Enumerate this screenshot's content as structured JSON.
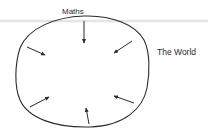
{
  "diagram": {
    "labels": {
      "top": "Maths",
      "right": "The World"
    },
    "colors": {
      "stroke": "#2a2a2a",
      "background": "#ffffff",
      "band": "#cdcdcd"
    },
    "arrows": [
      {
        "name": "arrow-top",
        "direction": "inward",
        "from": [
          84,
          21
        ],
        "to": [
          84,
          43
        ]
      },
      {
        "name": "arrow-upper-left",
        "direction": "inward",
        "from": [
          27,
          47
        ],
        "to": [
          45,
          55
        ]
      },
      {
        "name": "arrow-upper-right",
        "direction": "inward",
        "from": [
          132,
          41
        ],
        "to": [
          114,
          53
        ]
      },
      {
        "name": "arrow-lower-left",
        "direction": "inward",
        "from": [
          30,
          107
        ],
        "to": [
          49,
          97
        ]
      },
      {
        "name": "arrow-lower-right",
        "direction": "inward",
        "from": [
          134,
          103
        ],
        "to": [
          114,
          96
        ]
      },
      {
        "name": "arrow-bottom",
        "direction": "inward",
        "from": [
          89,
          124
        ],
        "to": [
          86,
          108
        ]
      }
    ]
  }
}
